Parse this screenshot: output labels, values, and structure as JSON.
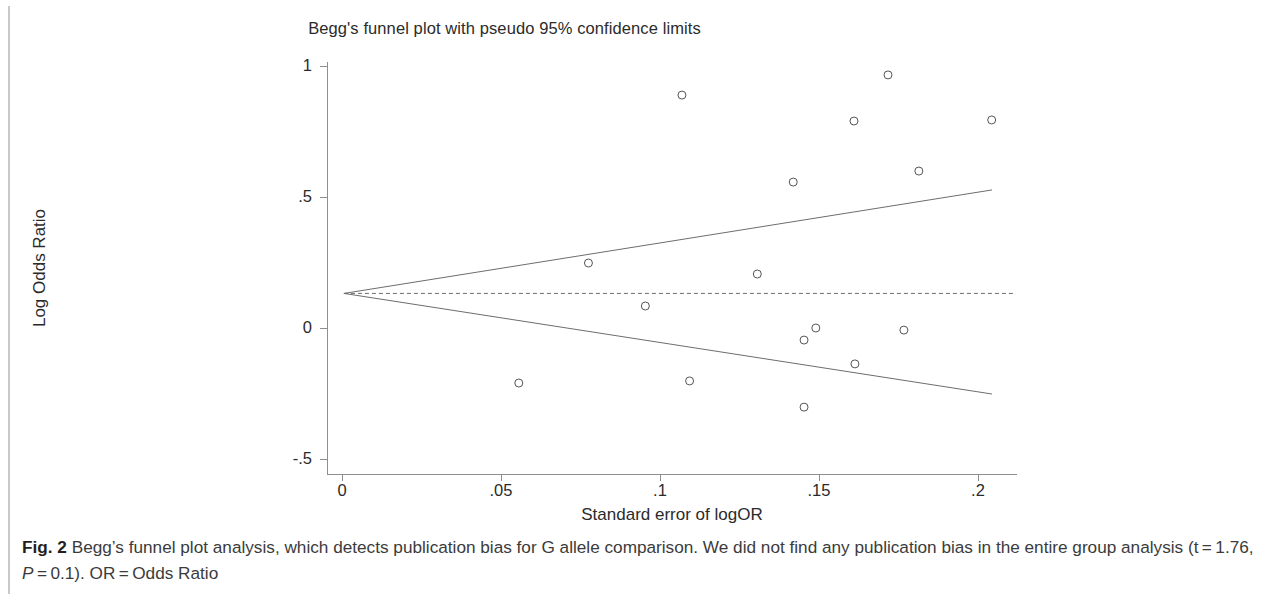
{
  "figure": {
    "chart_title": "Begg's funnel plot with pseudo 95% confidence limits",
    "caption_label": "Fig. 2",
    "caption_line1": "Begg’s funnel plot analysis, which detects publication bias for G allele comparison. We did not find any publication bias in the entire",
    "caption_line2_a": "group analysis (t = 1.76, ",
    "caption_line2_italic": "P",
    "caption_line2_b": " = 0.1). OR = Odds Ratio"
  },
  "chart_data": {
    "type": "scatter",
    "title": "Begg's funnel plot with pseudo 95% confidence limits",
    "xlabel": "Standard  error of logOR",
    "ylabel": "Log Odds Ratio",
    "xlim": [
      0,
      0.2044
    ],
    "ylim": [
      -0.5,
      1.0
    ],
    "grid": false,
    "legend": null,
    "xticks": [
      0,
      0.05,
      0.1,
      0.15,
      0.2
    ],
    "xticklabels": [
      "0",
      ".05",
      ".1",
      ".15",
      ".2"
    ],
    "yticks": [
      -0.5,
      0,
      0.5,
      1
    ],
    "yticklabels": [
      "-.5",
      "0",
      ".5",
      "1"
    ],
    "pooled_effect": 0.132,
    "pooled_line": {
      "label": "pooled log odds ratio",
      "y": 0.132,
      "style": "dashed"
    },
    "pseudo_ci_limits": {
      "label": "pseudo 95% confidence limits",
      "style": "solid",
      "apex": {
        "x": 0.0006,
        "y": 0.132
      },
      "upper_end": {
        "x": 0.2044,
        "y": 0.527
      },
      "lower_end": {
        "x": 0.2044,
        "y": -0.252
      }
    },
    "points": [
      {
        "se": 0.0556,
        "logor": -0.21
      },
      {
        "se": 0.0775,
        "logor": 0.248
      },
      {
        "se": 0.0954,
        "logor": 0.084
      },
      {
        "se": 0.1069,
        "logor": 0.889
      },
      {
        "se": 0.1093,
        "logor": -0.202
      },
      {
        "se": 0.1306,
        "logor": 0.206
      },
      {
        "se": 0.1419,
        "logor": 0.557
      },
      {
        "se": 0.1453,
        "logor": -0.046
      },
      {
        "se": 0.1453,
        "logor": -0.302
      },
      {
        "se": 0.149,
        "logor": 0.0
      },
      {
        "se": 0.161,
        "logor": 0.79
      },
      {
        "se": 0.1613,
        "logor": -0.137
      },
      {
        "se": 0.1717,
        "logor": 0.966
      },
      {
        "se": 0.1767,
        "logor": -0.008
      },
      {
        "se": 0.1814,
        "logor": 0.599
      },
      {
        "se": 0.2043,
        "logor": 0.794
      }
    ],
    "marker": {
      "shape": "circle",
      "filled": false,
      "size": 4,
      "color": "#555555"
    }
  },
  "colors": {
    "axis": "#8e8e8e",
    "text": "#2b2b2b",
    "caption_text": "#3b3b3b",
    "line": "#6d6d6d",
    "marker": "#555555",
    "rule": "#c9c9c9",
    "background": "#ffffff"
  }
}
